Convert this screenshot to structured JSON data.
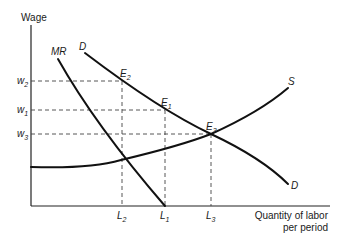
{
  "diagram": {
    "axes": {
      "y_label": "Wage",
      "x_label_line1": "Quantity of labor",
      "x_label_line2": "per period"
    },
    "curves": {
      "mr": {
        "label": "MR",
        "base": "MR",
        "sub": ""
      },
      "demand": {
        "label": "D"
      },
      "demand_end": {
        "label": "D"
      },
      "supply": {
        "label": "S"
      }
    },
    "y_ticks": [
      {
        "base": "w",
        "sub": "2"
      },
      {
        "base": "w",
        "sub": "1"
      },
      {
        "base": "w",
        "sub": "3"
      }
    ],
    "x_ticks": [
      {
        "base": "L",
        "sub": "2"
      },
      {
        "base": "L",
        "sub": "1"
      },
      {
        "base": "L",
        "sub": "3"
      }
    ],
    "points": [
      {
        "base": "E",
        "sub": "2"
      },
      {
        "base": "E",
        "sub": "1"
      },
      {
        "base": "E",
        "sub": "3"
      }
    ]
  }
}
